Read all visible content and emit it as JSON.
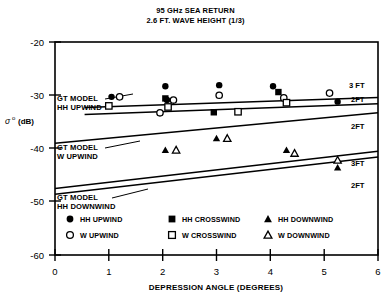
{
  "chart_data": {
    "type": "scatter",
    "title": "95 GHz SEA RETURN",
    "subtitle": "2.6 FT. WAVE HEIGHT (1/3)",
    "xlabel": "DEPRESSION ANGLE (DEGREES)",
    "ylabel": "σ° (dB)",
    "ylabel_symbol": "σ",
    "ylabel_sup": "o",
    "ylabel_unit": "(dB)",
    "xlim": [
      0,
      6
    ],
    "ylim": [
      -60,
      -20
    ],
    "xticks": [
      "0",
      "1",
      "2",
      "3",
      "4",
      "5",
      "6"
    ],
    "yticks": [
      "-20",
      "-30",
      "-40",
      "-50",
      "-60"
    ],
    "grid": false,
    "legend_position": "inside-bottom",
    "series": [
      {
        "name": "HH UPWIND",
        "marker": "filled-circle",
        "points": [
          {
            "x": 1.05,
            "y": -30.3
          },
          {
            "x": 2.05,
            "y": -28.3
          },
          {
            "x": 2.08,
            "y": -30.9
          },
          {
            "x": 3.05,
            "y": -28.1
          },
          {
            "x": 4.05,
            "y": -28.3
          },
          {
            "x": 5.25,
            "y": -31.2
          }
        ]
      },
      {
        "name": "W UPWIND",
        "marker": "open-circle",
        "points": [
          {
            "x": 1.2,
            "y": -30.3
          },
          {
            "x": 1.95,
            "y": -33.3
          },
          {
            "x": 2.2,
            "y": -30.9
          },
          {
            "x": 3.05,
            "y": -30.0
          },
          {
            "x": 4.25,
            "y": -30.5
          },
          {
            "x": 5.1,
            "y": -29.6
          }
        ]
      },
      {
        "name": "HH CROSSWIND",
        "marker": "filled-square",
        "points": [
          {
            "x": 2.05,
            "y": -30.6
          },
          {
            "x": 2.95,
            "y": -33.2
          },
          {
            "x": 4.15,
            "y": -29.4
          }
        ]
      },
      {
        "name": "W CROSSWIND",
        "marker": "open-square",
        "points": [
          {
            "x": 1.0,
            "y": -32.0
          },
          {
            "x": 2.1,
            "y": -32.2
          },
          {
            "x": 3.4,
            "y": -33.1
          },
          {
            "x": 4.3,
            "y": -31.4
          }
        ]
      },
      {
        "name": "HH DOWNWIND",
        "marker": "filled-triangle",
        "points": [
          {
            "x": 2.05,
            "y": -40.3
          },
          {
            "x": 3.0,
            "y": -38.1
          },
          {
            "x": 4.3,
            "y": -40.3
          },
          {
            "x": 5.25,
            "y": -43.6
          }
        ]
      },
      {
        "name": "W DOWNWIND",
        "marker": "open-triangle",
        "points": [
          {
            "x": 2.25,
            "y": -40.3
          },
          {
            "x": 3.2,
            "y": -38.1
          },
          {
            "x": 4.45,
            "y": -40.9
          },
          {
            "x": 5.25,
            "y": -42.2
          }
        ]
      }
    ],
    "model_curves": [
      {
        "label": "GT MODEL HH UPWIND",
        "right_label": "3 FT",
        "x": [
          0.55,
          6.0
        ],
        "y": [
          -32.3,
          -30.4
        ]
      },
      {
        "label": "GT MODEL HH UPWIND",
        "right_label": "2FT",
        "x": [
          0.55,
          6.0
        ],
        "y": [
          -33.6,
          -31.6
        ]
      },
      {
        "label": "GT MODEL W UPWIND",
        "right_label": "2FT",
        "x": [
          0.0,
          6.0
        ],
        "y": [
          -39.0,
          -33.3
        ]
      },
      {
        "label": "GT MODEL HH DOWNWIND",
        "right_label": "3FT",
        "x": [
          0.0,
          6.0
        ],
        "y": [
          -47.5,
          -40.5
        ]
      },
      {
        "label": "GT MODEL HH DOWNWIND",
        "right_label": "2FT",
        "x": [
          0.0,
          6.0
        ],
        "y": [
          -48.6,
          -41.6
        ]
      }
    ],
    "annotations": [
      {
        "id": "ann-1",
        "line1": "GT MODEL",
        "line2": "HH UPWIND"
      },
      {
        "id": "ann-2",
        "line1": "GT MODEL",
        "line2": "W UPWIND"
      },
      {
        "id": "ann-3",
        "line1": "GT MODEL",
        "line2": "HH DOWNWIND"
      }
    ],
    "curve_right_labels": [
      "3 FT",
      "2FT",
      "2FT",
      "3FT",
      "2FT"
    ],
    "legend": [
      {
        "label": "HH UPWIND",
        "marker": "filled-circle"
      },
      {
        "label": "HH CROSSWIND",
        "marker": "filled-square"
      },
      {
        "label": "HH DOWNWIND",
        "marker": "filled-triangle"
      },
      {
        "label": "W UPWIND",
        "marker": "open-circle"
      },
      {
        "label": "W CROSSWIND",
        "marker": "open-square"
      },
      {
        "label": "W DOWNWIND",
        "marker": "open-triangle"
      }
    ],
    "colors": {
      "ink": "#000000",
      "background": "#ffffff"
    }
  }
}
